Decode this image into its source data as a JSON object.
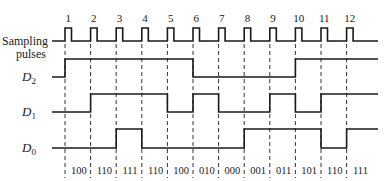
{
  "colors": {
    "ink": "#1a1a1a",
    "background": "#ffffff"
  },
  "signals": [
    {
      "id": "sampling",
      "label": "Sampling",
      "label2": "pulses"
    },
    {
      "id": "d2",
      "label": "D",
      "sub": "2",
      "levels": [
        1,
        1,
        1,
        1,
        1,
        0,
        0,
        0,
        0,
        1,
        1,
        1
      ]
    },
    {
      "id": "d1",
      "label": "D",
      "sub": "1",
      "levels": [
        0,
        1,
        1,
        1,
        0,
        1,
        0,
        0,
        1,
        0,
        1,
        1
      ]
    },
    {
      "id": "d0",
      "label": "D",
      "sub": "0",
      "levels": [
        0,
        0,
        1,
        0,
        0,
        0,
        0,
        1,
        1,
        1,
        0,
        1
      ]
    }
  ],
  "pulses": [
    "1",
    "2",
    "3",
    "4",
    "5",
    "6",
    "7",
    "8",
    "9",
    "10",
    "11",
    "12"
  ],
  "states": [
    "100",
    "110",
    "111",
    "110",
    "100",
    "010",
    "000",
    "001",
    "011",
    "101",
    "110",
    "111"
  ]
}
